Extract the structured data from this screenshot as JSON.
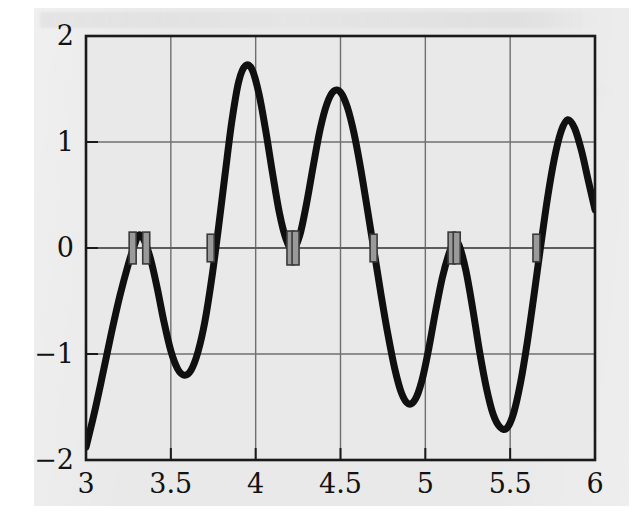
{
  "chart_data": {
    "type": "line",
    "title": "",
    "subtitle": "",
    "xlabel": "",
    "ylabel": "",
    "xlim": [
      3,
      6
    ],
    "ylim": [
      -2,
      2
    ],
    "grid": true,
    "legend": null,
    "x_ticks": [
      "3",
      "3.5",
      "4",
      "4.5",
      "5",
      "5.5",
      "6"
    ],
    "x_tick_values": [
      3,
      3.5,
      4,
      4.5,
      5,
      5.5,
      6
    ],
    "y_ticks": [
      "2",
      "1",
      "0",
      "−1",
      "−2"
    ],
    "y_tick_values": [
      2,
      1,
      0,
      -1,
      -2
    ],
    "series": [
      {
        "name": "f(x)",
        "color": "#101010",
        "line_width": 7,
        "x": [
          3.0,
          3.05,
          3.1,
          3.15,
          3.2,
          3.25,
          3.28,
          3.31,
          3.34,
          3.38,
          3.42,
          3.46,
          3.5,
          3.54,
          3.58,
          3.62,
          3.66,
          3.7,
          3.74,
          3.78,
          3.82,
          3.86,
          3.9,
          3.94,
          3.98,
          4.02,
          4.06,
          4.1,
          4.14,
          4.18,
          4.22,
          4.26,
          4.3,
          4.34,
          4.38,
          4.42,
          4.46,
          4.5,
          4.54,
          4.58,
          4.62,
          4.66,
          4.7,
          4.74,
          4.78,
          4.82,
          4.86,
          4.9,
          4.94,
          4.98,
          5.02,
          5.06,
          5.1,
          5.14,
          5.17,
          5.2,
          5.24,
          5.28,
          5.32,
          5.36,
          5.4,
          5.44,
          5.48,
          5.52,
          5.56,
          5.6,
          5.64,
          5.68,
          5.72,
          5.76,
          5.8,
          5.84,
          5.88,
          5.92,
          5.96,
          6.0
        ],
        "y": [
          -1.88,
          -1.55,
          -1.18,
          -0.8,
          -0.45,
          -0.15,
          0.0,
          0.12,
          0.08,
          -0.1,
          -0.38,
          -0.7,
          -0.97,
          -1.14,
          -1.2,
          -1.15,
          -0.98,
          -0.7,
          -0.3,
          0.18,
          0.7,
          1.2,
          1.57,
          1.72,
          1.68,
          1.45,
          1.1,
          0.7,
          0.33,
          0.08,
          -0.02,
          0.12,
          0.42,
          0.78,
          1.12,
          1.36,
          1.48,
          1.47,
          1.33,
          1.08,
          0.74,
          0.35,
          -0.05,
          -0.45,
          -0.82,
          -1.14,
          -1.37,
          -1.47,
          -1.43,
          -1.25,
          -0.95,
          -0.6,
          -0.28,
          -0.05,
          0.06,
          0.02,
          -0.22,
          -0.58,
          -0.98,
          -1.32,
          -1.57,
          -1.69,
          -1.7,
          -1.56,
          -1.28,
          -0.9,
          -0.45,
          0.02,
          0.47,
          0.84,
          1.1,
          1.21,
          1.13,
          0.92,
          0.64,
          0.36
        ]
      }
    ],
    "annotations": {
      "name": "root-bracket-markers",
      "description": "Grey vertical bar markers placed on the y = 0 axis at bracketed zero crossings",
      "color": "#9a9a9a",
      "border_color": "#3a3a3a",
      "markers": [
        {
          "x": 3.275,
          "y": 0,
          "width": 0.028,
          "height": 0.3
        },
        {
          "x": 3.355,
          "y": 0,
          "width": 0.028,
          "height": 0.3
        },
        {
          "x": 3.735,
          "y": 0,
          "width": 0.022,
          "height": 0.26
        },
        {
          "x": 4.205,
          "y": 0,
          "width": 0.022,
          "height": 0.32
        },
        {
          "x": 4.235,
          "y": 0,
          "width": 0.022,
          "height": 0.32
        },
        {
          "x": 4.695,
          "y": 0,
          "width": 0.022,
          "height": 0.26
        },
        {
          "x": 5.155,
          "y": 0,
          "width": 0.02,
          "height": 0.3
        },
        {
          "x": 5.185,
          "y": 0,
          "width": 0.02,
          "height": 0.3
        },
        {
          "x": 5.655,
          "y": 0,
          "width": 0.022,
          "height": 0.26
        }
      ]
    },
    "key_points": {
      "start": {
        "x": 3.0,
        "y": -1.88
      },
      "end": {
        "x": 6.0,
        "y": 0.36
      },
      "maxima": [
        {
          "x": 3.31,
          "y": 0.12
        },
        {
          "x": 3.94,
          "y": 1.72
        },
        {
          "x": 4.52,
          "y": 1.49
        },
        {
          "x": 5.17,
          "y": 0.06
        },
        {
          "x": 5.84,
          "y": 1.21
        }
      ],
      "minima": [
        {
          "x": 3.58,
          "y": -1.2
        },
        {
          "x": 4.23,
          "y": -0.03
        },
        {
          "x": 4.89,
          "y": -1.47
        },
        {
          "x": 5.47,
          "y": -1.7
        }
      ]
    },
    "colors": {
      "plot_background": "#e9e9e9",
      "page_background": "#ffffff",
      "axis": "#1a1a1a",
      "grid": "#6a6a6a",
      "curve": "#101010",
      "marker_fill": "#9a9a9a",
      "marker_stroke": "#3a3a3a"
    }
  }
}
